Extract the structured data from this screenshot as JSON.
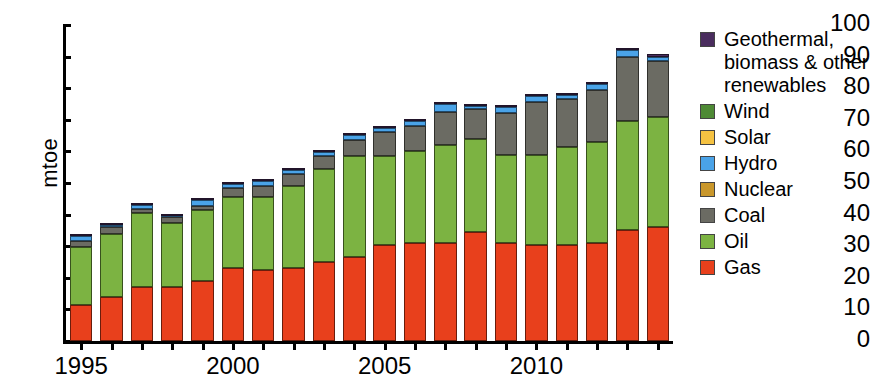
{
  "chart_data": {
    "type": "bar",
    "stacked": true,
    "title": "",
    "xlabel": "",
    "ylabel": "mtoe",
    "ylim": [
      0,
      100
    ],
    "ytick_step": 10,
    "yticks": [
      0,
      10,
      20,
      30,
      40,
      50,
      60,
      70,
      80,
      90,
      100
    ],
    "grid": false,
    "legend_position": "right",
    "categories": [
      1995,
      1996,
      1997,
      1998,
      1999,
      2000,
      2001,
      2002,
      2003,
      2004,
      2005,
      2006,
      2007,
      2008,
      2009,
      2010,
      2011,
      2012,
      2013,
      2014
    ],
    "xtick_labels": [
      "1995",
      "2000",
      "2005",
      "2010"
    ],
    "xtick_categories": [
      1995,
      2000,
      2005,
      2010
    ],
    "series": [
      {
        "name": "Gas",
        "color": "#e8401c",
        "values": [
          11.5,
          14.0,
          17.0,
          17.0,
          19.0,
          23.0,
          22.5,
          23.0,
          25.0,
          26.5,
          30.5,
          31.0,
          31.0,
          34.5,
          31.0,
          30.5,
          30.5,
          31.0,
          35.0,
          36.0
        ]
      },
      {
        "name": "Oil",
        "color": "#7cb342",
        "values": [
          18.2,
          19.8,
          23.5,
          20.3,
          22.5,
          22.5,
          23.0,
          26.0,
          29.5,
          32.0,
          28.0,
          29.0,
          31.0,
          29.5,
          28.0,
          28.5,
          31.0,
          32.0,
          34.5,
          35.0
        ]
      },
      {
        "name": "Coal",
        "color": "#6b6b63",
        "values": [
          2.0,
          2.3,
          1.4,
          1.9,
          1.3,
          3.0,
          3.5,
          4.0,
          4.0,
          5.0,
          7.5,
          8.0,
          10.5,
          9.5,
          13.0,
          16.5,
          15.0,
          16.5,
          20.5,
          17.5
        ]
      },
      {
        "name": "Nuclear",
        "color": "#c9972b",
        "values": [
          0,
          0,
          0,
          0,
          0,
          0,
          0,
          0,
          0,
          0,
          0,
          0,
          0,
          0,
          0,
          0,
          0,
          0,
          0,
          0
        ]
      },
      {
        "name": "Hydro",
        "color": "#4aa3e8",
        "values": [
          1.6,
          0.6,
          1.2,
          0.5,
          1.8,
          1.1,
          1.7,
          1.1,
          1.3,
          1.7,
          1.5,
          1.5,
          2.6,
          0.9,
          2.2,
          2.0,
          1.2,
          1.8,
          2.0,
          1.3
        ]
      },
      {
        "name": "Solar",
        "color": "#f5c242",
        "values": [
          0,
          0,
          0,
          0,
          0,
          0,
          0,
          0,
          0,
          0,
          0,
          0,
          0,
          0,
          0,
          0,
          0,
          0,
          0,
          0
        ]
      },
      {
        "name": "Wind",
        "color": "#4e8a35",
        "values": [
          0,
          0,
          0,
          0,
          0,
          0,
          0,
          0,
          0,
          0,
          0,
          0,
          0,
          0,
          0,
          0,
          0,
          0,
          0,
          0
        ]
      },
      {
        "name": "Geothermal, biomass & other renewables",
        "color": "#4a2d5e",
        "values": [
          0.2,
          0.2,
          0.2,
          0.2,
          0.2,
          0.3,
          0.3,
          0.3,
          0.3,
          0.3,
          0.4,
          0.4,
          0.5,
          0.5,
          0.6,
          0.6,
          0.6,
          0.7,
          0.8,
          0.9
        ]
      }
    ],
    "totals": [
      33.5,
      36.9,
      43.3,
      39.9,
      44.8,
      49.9,
      51.0,
      54.4,
      60.1,
      65.5,
      67.9,
      69.9,
      75.6,
      74.9,
      74.8,
      78.1,
      78.3,
      82.0,
      92.8,
      90.7
    ]
  },
  "legend": {
    "entries": [
      {
        "label": "Geothermal, biomass & other renewables",
        "color": "#4a2d5e",
        "name": "legend-geothermal"
      },
      {
        "label": "Wind",
        "color": "#4e8a35",
        "name": "legend-wind"
      },
      {
        "label": "Solar",
        "color": "#f5c242",
        "name": "legend-solar"
      },
      {
        "label": "Hydro",
        "color": "#4aa3e8",
        "name": "legend-hydro"
      },
      {
        "label": "Nuclear",
        "color": "#c9972b",
        "name": "legend-nuclear"
      },
      {
        "label": "Coal",
        "color": "#6b6b63",
        "name": "legend-coal"
      },
      {
        "label": "Oil",
        "color": "#7cb342",
        "name": "legend-oil"
      },
      {
        "label": "Gas",
        "color": "#e8401c",
        "name": "legend-gas"
      }
    ]
  }
}
